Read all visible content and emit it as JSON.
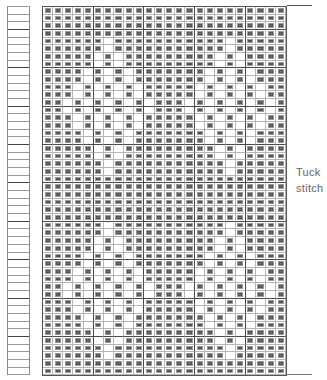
{
  "diagram": {
    "type": "knitting-chart",
    "columns": 24,
    "rows": 48,
    "label_line1": "Tuck",
    "label_line2": "stitch",
    "strip_rows": 48,
    "thick_col_every": 5,
    "thick_row_offsets": [
      3,
      8,
      13,
      18,
      23,
      28,
      33,
      38,
      43
    ],
    "legend": {
      "filled": "knit stitch",
      "empty": "tuck stitch"
    },
    "colors": {
      "filled": "#6f6f6f",
      "empty": "#ffffff",
      "grid": "#b5b5b5",
      "thick": "#4a4a4a"
    },
    "pattern_rows": [
      "XXXXXXXXXXXXXXXXXXXXXXXX",
      "XXXXXXXXXXXXXXXXXXXXXXXX",
      "XXXXXXXXXXXXXXXXXXXXXXXX",
      "XXXXXXXXXXXXXXXXXXXXXXXX",
      "XXXXXX.XXXXXXXXXXX.XXXXX",
      "XXXXXX.XXXXXXXXXXX.XXXXX",
      "XXXXX.X.XXXXXXXXX.X.XXXX",
      "XXXXX.X.XXXXXXXXX.X.XXXX",
      "XXXX.X.X.XXXXXXX.X.X.XXX",
      "XXXX.X.X.XXXXXXX.X.X.XXX",
      "XXX.X.X.X.XXXXX.X.X.X.XX",
      "XXX.X.X.X.XXXXX.X.X.X.XX",
      "XX.X.X.X.X.XXX.X.X.X.X.X",
      "XX.X.X.X.X.XXX.X.X.X.X.X",
      "XXX.X.X.X.XXXXX.X.X.X.XX",
      "XXX.X.X.X.XXXXX.X.X.X.XX",
      "XXXX.X.X.XXXXXXX.X.X.XXX",
      "XXXX.X.X.XXXXXXX.X.X.XXX",
      "XXXXX.X.XXXXXXXXX.X.XXXX",
      "XXXXX.X.XXXXXXXXX.X.XXXX",
      "XXXXXX.XXXXXXXXXXX.XXXXX",
      "XXXXXX.XXXXXXXXXXX.XXXXX",
      "XXXXXXXXXXXXXXXXXXXXXXXX",
      "XXXXXXXXXXXXXXXXXXXXXXXX",
      "XXXXXXXXXXXXXXXXXXXXXXXX",
      "XXXXXXXXXXXXXXXXXXXXXXXX",
      "XXXXXXXXXXXXXXXXXXXXXXXX",
      "XXXXXXXXXXXXXXXXXXXXXXXX",
      "XXXXXX.XXXXXXXXXXX.XXXXX",
      "XXXXXX.XXXXXXXXXXX.XXXXX",
      "XXXXX.X.XXXXXXXXX.X.XXXX",
      "XXXXX.X.XXXXXXXXX.X.XXXX",
      "XXXX.X.X.XXXXXXX.X.X.XXX",
      "XXXX.X.X.XXXXXXX.X.X.XXX",
      "XXX.X.X.X.XXXXX.X.X.X.XX",
      "XXX.X.X.X.XXXXX.X.X.X.XX",
      "XX.X.X.X.X.XXX.X.X.X.X.X",
      "XX.X.X.X.X.XXX.X.X.X.X.X",
      "XXX.X.X.X.XXXXX.X.X.X.XX",
      "XXX.X.X.X.XXXXX.X.X.X.XX",
      "XXXX.X.X.XXXXXXX.X.X.XXX",
      "XXXX.X.X.XXXXXXX.X.X.XXX",
      "XXXXX.X.XXXXXXXXX.X.XXXX",
      "XXXXX.X.XXXXXXXXX.X.XXXX",
      "XXXXXX.XXXXXXXXXXX.XXXXX",
      "XXXXXX.XXXXXXXXXXX.XXXXX",
      "XXXXXXXXXXXXXXXXXXXXXXXX",
      "XXXXXXXXXXXXXXXXXXXXXXXX"
    ]
  }
}
